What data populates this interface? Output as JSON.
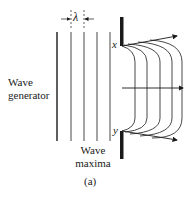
{
  "diagram": {
    "labels": {
      "wave_generator_line1": "Wave",
      "wave_generator_line2": "generator",
      "wave_maxima_line1": "Wave",
      "wave_maxima_line2": "maxima",
      "lambda": "λ",
      "point_x": "x",
      "point_y": "y",
      "caption": "(a)"
    },
    "wave_maxima_lines_x": [
      57,
      71,
      84,
      97,
      110
    ],
    "diffracted_arcs_x": [
      135,
      147,
      160,
      172,
      182
    ],
    "colors": {
      "ink": "#1a1a1a",
      "background": "#ffffff"
    }
  }
}
